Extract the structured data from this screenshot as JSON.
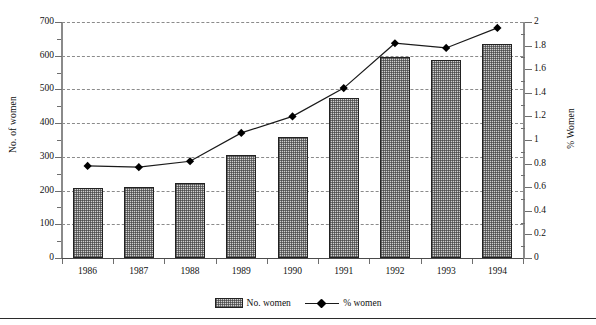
{
  "chart_data": {
    "type": "bar",
    "title": "",
    "subtitle": "",
    "xlabel": "",
    "ylabel": "No. of women",
    "y2label": "% Women",
    "categories": [
      "1986",
      "1987",
      "1988",
      "1989",
      "1990",
      "1991",
      "1992",
      "1993",
      "1994"
    ],
    "ylim": [
      0,
      700
    ],
    "y_ticks": [
      0,
      100,
      200,
      300,
      400,
      500,
      600,
      700
    ],
    "y2lim": [
      0,
      2
    ],
    "y2_ticks": [
      0,
      0.2,
      0.4,
      0.6,
      0.8,
      1,
      1.2,
      1.4,
      1.6,
      1.8,
      2
    ],
    "y2_tick_labels": [
      "0",
      "0.2",
      "0.4",
      "0.6",
      "0.8",
      "1",
      "1.2",
      "1.4",
      "1.6",
      "1.8",
      "2"
    ],
    "grid": true,
    "legend_position": "bottom",
    "series": [
      {
        "name": "No. women",
        "type": "bar",
        "axis": "left",
        "values": [
          208,
          210,
          222,
          305,
          358,
          475,
          595,
          587,
          635
        ]
      },
      {
        "name": "% women",
        "type": "line",
        "axis": "right",
        "marker": "diamond",
        "values": [
          0.78,
          0.77,
          0.82,
          1.06,
          1.2,
          1.44,
          1.82,
          1.78,
          1.95
        ]
      }
    ]
  },
  "legend": {
    "bar_label": "No. women",
    "line_label": "% women"
  }
}
